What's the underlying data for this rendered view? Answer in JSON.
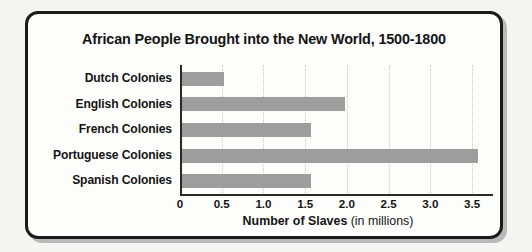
{
  "figure": {
    "frame_color": "#1b1b1b",
    "background": "#fdfdfb",
    "bar_color": "#9d9d9d",
    "grid_color": "#c8c8c8"
  },
  "chart_data": {
    "type": "bar",
    "orientation": "horizontal",
    "title": "African People Brought into the New World, 1500-1800",
    "xlabel_bold": "Number of Slaves",
    "xlabel_unit": " (in millions)",
    "ylabel": "",
    "categories": [
      "Dutch Colonies",
      "English Colonies",
      "French Colonies",
      "Portuguese Colonies",
      "Spanish Colonies"
    ],
    "values": [
      0.5,
      1.95,
      1.55,
      3.55,
      1.55
    ],
    "xlim": [
      0,
      3.75
    ],
    "xticks": [
      0,
      0.5,
      1.0,
      1.5,
      2.0,
      2.5,
      3.0,
      3.5
    ],
    "xtick_labels": [
      "0",
      "0.5",
      "1.0",
      "1.5",
      "2.0",
      "2.5",
      "3.0",
      "3.5"
    ],
    "grid": "vertical-dotted",
    "legend": "none"
  }
}
